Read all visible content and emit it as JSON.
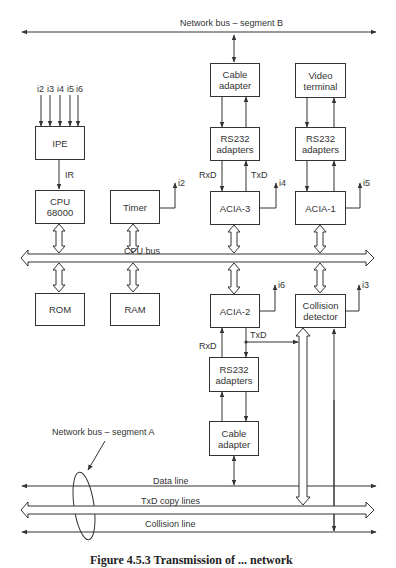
{
  "figure": {
    "network_bus_b": "Network bus – segment B",
    "network_bus_a": "Network bus – segment A",
    "cpu_bus": "CPU bus",
    "data_line": "Data line",
    "txd_copy_lines": "TxD copy lines",
    "collision_line": "Collision line",
    "caption": "Figure 4.5.3  Transmission of ... network"
  },
  "blocks": {
    "cable_adapter_top": [
      "Cable",
      "adapter"
    ],
    "video_terminal": [
      "Video",
      "terminal"
    ],
    "rs232_top_left": [
      "RS232",
      "adapters"
    ],
    "rs232_top_right": [
      "RS232",
      "adapters"
    ],
    "ipe": "IPE",
    "cpu": [
      "CPU",
      "68000"
    ],
    "timer": "Timer",
    "acia3": "ACIA-3",
    "acia1": "ACIA-1",
    "rom": "ROM",
    "ram": "RAM",
    "acia2": "ACIA-2",
    "collision_detector": [
      "Collision",
      "detector"
    ],
    "rs232_bottom": [
      "RS232",
      "adapters"
    ],
    "cable_adapter_bottom": [
      "Cable",
      "adapter"
    ]
  },
  "signals": {
    "interrupt_inputs": [
      "i2",
      "i3",
      "i4",
      "i5",
      "i6"
    ],
    "ir": "IR",
    "timer_irq": "i2",
    "acia3_irq": "i4",
    "acia1_irq": "i5",
    "acia2_irq": "i6",
    "collision_irq": "i3",
    "rxd_top": "RxD",
    "txd_top": "TxD",
    "rxd_bottom": "RxD",
    "txd_bottom": "TxD"
  }
}
